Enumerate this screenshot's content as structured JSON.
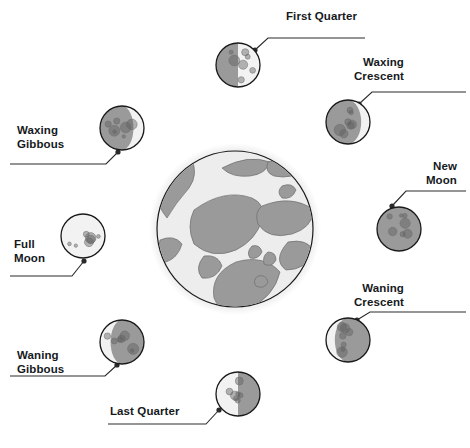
{
  "diagram": {
    "center_body": "Earth",
    "colors": {
      "moon_dark": "#9a9a9a",
      "moon_light": "#f2f2f2",
      "outline": "#1a1a1a",
      "earth_land": "#9a9a9a",
      "earth_ocean": "#ededed",
      "earth_halo": "#e2e2e2",
      "text": "#16191c",
      "leader_line": "#2a2a2a"
    },
    "background": "#ffffff"
  },
  "earth": {
    "name": "Earth",
    "cx": 235,
    "cy": 229,
    "r": 78
  },
  "phases": [
    {
      "id": "first-quarter",
      "label": "First Quarter",
      "label_lines": [
        "First Quarter"
      ],
      "label_align": "left",
      "label_x": 286,
      "label_y": 10,
      "illumination": "50%",
      "lit_side": "right",
      "shape": "half-right",
      "moon_cx": 238,
      "moon_cy": 65,
      "moon_r": 22,
      "dot_x": 255,
      "dot_y": 50,
      "leader": "M 255 50 L 268 38 L 365 38"
    },
    {
      "id": "waxing-crescent",
      "label": "Waxing Crescent",
      "label_lines": [
        "Waxing",
        "Crescent"
      ],
      "label_align": "right",
      "label_x": 404,
      "label_y": 56,
      "illumination": "25%",
      "lit_side": "right",
      "shape": "crescent-right",
      "moon_cx": 348,
      "moon_cy": 122,
      "moon_r": 22,
      "dot_x": 359,
      "dot_y": 104,
      "leader": "M 359 104 L 372 92 L 466 92"
    },
    {
      "id": "new-moon",
      "label": "New Moon",
      "label_lines": [
        "New",
        "Moon"
      ],
      "label_align": "right",
      "label_x": 457,
      "label_y": 160,
      "illumination": "0%",
      "lit_side": "none",
      "shape": "full-dark",
      "moon_cx": 399,
      "moon_cy": 229,
      "moon_r": 22,
      "dot_x": 392,
      "dot_y": 206,
      "leader": "M 392 206 L 406 191 L 466 191"
    },
    {
      "id": "waning-crescent",
      "label": "Waning Crescent",
      "label_lines": [
        "Waning",
        "Crescent"
      ],
      "label_align": "right",
      "label_x": 404,
      "label_y": 282,
      "illumination": "25%",
      "lit_side": "left",
      "shape": "crescent-left",
      "moon_cx": 348,
      "moon_cy": 340,
      "moon_r": 22,
      "dot_x": 357,
      "dot_y": 320,
      "leader": "M 357 320 L 370 312 L 466 312"
    },
    {
      "id": "last-quarter",
      "label": "Last Quarter",
      "label_lines": [
        "Last Quarter"
      ],
      "label_align": "left",
      "label_x": 110,
      "label_y": 405,
      "illumination": "50%",
      "lit_side": "left",
      "shape": "half-left",
      "moon_cx": 238,
      "moon_cy": 394,
      "moon_r": 22,
      "dot_x": 219,
      "dot_y": 410,
      "leader": "M 219 410 L 206 424 L 108 424"
    },
    {
      "id": "waning-gibbous",
      "label": "Waning Gibbous",
      "label_lines": [
        "Waning",
        "Gibbous"
      ],
      "label_align": "left",
      "label_x": 17,
      "label_y": 349,
      "illumination": "75%",
      "lit_side": "left",
      "shape": "gibbous-left",
      "moon_cx": 122,
      "moon_cy": 342,
      "moon_r": 22,
      "dot_x": 117,
      "dot_y": 365,
      "leader": "M 117 365 L 105 376 L 10 376"
    },
    {
      "id": "full-moon",
      "label": "Full Moon",
      "label_lines": [
        "Full",
        "Moon"
      ],
      "label_align": "left",
      "label_x": 14,
      "label_y": 238,
      "illumination": "100%",
      "lit_side": "all",
      "shape": "full-light",
      "moon_cx": 83,
      "moon_cy": 236,
      "moon_r": 22,
      "dot_x": 84,
      "dot_y": 261,
      "leader": "M 84 261 L 72 276 L 10 276"
    },
    {
      "id": "waxing-gibbous",
      "label": "Waxing Gibbous",
      "label_lines": [
        "Waxing",
        "Gibbous"
      ],
      "label_align": "left",
      "label_x": 17,
      "label_y": 124,
      "illumination": "75%",
      "lit_side": "right",
      "shape": "gibbous-right",
      "moon_cx": 122,
      "moon_cy": 128,
      "moon_r": 22,
      "dot_x": 118,
      "dot_y": 152,
      "leader": "M 118 152 L 106 164 L 10 164"
    }
  ]
}
